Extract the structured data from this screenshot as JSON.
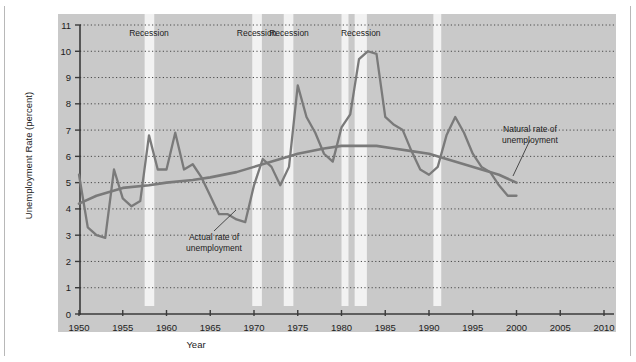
{
  "figure": {
    "background": "#ffffff",
    "panel_color": "#c9c9c9",
    "recession_band_color": "#f2f2f2",
    "series_color": "#7a7a7a",
    "gridline_color": "#4a4a4a",
    "axis_color": "#3a3a3a"
  },
  "labels": {
    "ylabel": "Unemployment Rate (percent)",
    "xlabel": "Year",
    "recession": "Recession",
    "annotation_actual": "Actual rate of\nunemployment",
    "annotation_actual_line1": "Actual rate of",
    "annotation_actual_line2": "unemployment",
    "annotation_natural_line1": "Natural rate of",
    "annotation_natural_line2": "unemployment"
  },
  "chart_data": {
    "type": "line",
    "title": "",
    "xlabel": "Year",
    "ylabel": "Unemployment Rate (percent)",
    "xlim": [
      1948,
      2011
    ],
    "ylim": [
      0,
      11
    ],
    "xticks": [
      1950,
      1955,
      1960,
      1965,
      1970,
      1975,
      1980,
      1985,
      1990,
      1995,
      2000,
      2005,
      2010
    ],
    "yticks": [
      0,
      1,
      2,
      3,
      4,
      5,
      6,
      7,
      8,
      9,
      10,
      11
    ],
    "grid": true,
    "legend": "annotations",
    "recession_bands": [
      {
        "start": 1957.5,
        "end": 1958.6,
        "label": "Recession"
      },
      {
        "start": 1969.8,
        "end": 1970.9,
        "label": "Recession"
      },
      {
        "start": 1973.4,
        "end": 1974.5,
        "label": "Recession"
      },
      {
        "start": 1980.0,
        "end": 1980.8,
        "label": "Recession"
      },
      {
        "start": 1981.5,
        "end": 1982.9,
        "label": "Recession"
      },
      {
        "start": 1990.5,
        "end": 1991.4,
        "label": "Recession"
      }
    ],
    "band_label_positions": [
      1958.0,
      1970.3,
      1974.0,
      1982.2
    ],
    "series": [
      {
        "name": "Actual rate of unemployment",
        "x": [
          1950,
          1951,
          1952,
          1953,
          1954,
          1955,
          1956,
          1957,
          1958,
          1959,
          1960,
          1961,
          1962,
          1963,
          1964,
          1965,
          1966,
          1967,
          1968,
          1969,
          1970,
          1971,
          1972,
          1973,
          1974,
          1975,
          1976,
          1977,
          1978,
          1979,
          1980,
          1981,
          1982,
          1983,
          1984,
          1985,
          1986,
          1987,
          1988,
          1989,
          1990,
          1991,
          1992,
          1993,
          1994,
          1995,
          1996,
          1997,
          1998,
          1999,
          2000
        ],
        "values": [
          5.3,
          3.3,
          3.0,
          2.9,
          5.5,
          4.4,
          4.1,
          4.3,
          6.8,
          5.5,
          5.5,
          6.9,
          5.5,
          5.7,
          5.2,
          4.5,
          3.8,
          3.8,
          3.6,
          3.5,
          4.9,
          5.9,
          5.6,
          4.9,
          5.6,
          8.7,
          7.5,
          6.9,
          6.1,
          5.8,
          7.1,
          7.6,
          9.7,
          10.0,
          9.9,
          7.5,
          7.2,
          7.0,
          6.2,
          5.5,
          5.3,
          5.6,
          6.8,
          7.5,
          6.9,
          6.1,
          5.6,
          5.4,
          4.9,
          4.5,
          4.5
        ]
      },
      {
        "name": "Natural rate of unemployment",
        "x": [
          1950,
          1952,
          1955,
          1958,
          1960,
          1963,
          1965,
          1968,
          1970,
          1973,
          1975,
          1978,
          1980,
          1982,
          1984,
          1986,
          1988,
          1990,
          1992,
          1994,
          1996,
          1998,
          2000
        ],
        "values": [
          4.2,
          4.5,
          4.8,
          4.9,
          5.0,
          5.1,
          5.2,
          5.4,
          5.6,
          5.9,
          6.1,
          6.3,
          6.4,
          6.4,
          6.4,
          6.3,
          6.2,
          6.1,
          5.9,
          5.7,
          5.5,
          5.3,
          5.0
        ]
      }
    ]
  }
}
